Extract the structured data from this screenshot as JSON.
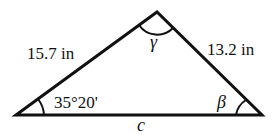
{
  "diagram": {
    "type": "triangle",
    "vertices": {
      "left": [
        16,
        115
      ],
      "top": [
        157,
        12
      ],
      "right": [
        262,
        115
      ]
    },
    "sides": {
      "left_side_label": "15.7 in",
      "right_side_label": "13.2 in",
      "base_label": "c"
    },
    "angles": {
      "left_angle_label": "35°20'",
      "top_angle_label": "γ",
      "right_angle_label": "β"
    },
    "colors": {
      "stroke": "#111111",
      "background": "#ffffff"
    }
  }
}
